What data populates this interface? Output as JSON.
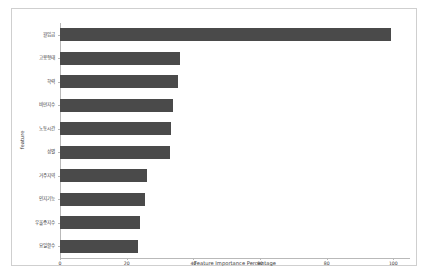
{
  "chart_data": {
    "type": "bar",
    "orientation": "horizontal",
    "title": "",
    "xlabel": "Feature Importance Percentage",
    "ylabel": "feature",
    "xlim": [
      0,
      105
    ],
    "xticks": [
      "0",
      "20",
      "40",
      "60",
      "80",
      "100"
    ],
    "xtick_values": [
      0,
      20,
      40,
      60,
      80,
      100
    ],
    "grid": false,
    "legend": null,
    "bar_color": "#4a4a4a",
    "background_color": "#ffffff",
    "frame_color": "#cfcfcf",
    "categories": [
      "월임금",
      "고용형태",
      "학력",
      "비만지수",
      "노동시간",
      "성별",
      "거주지역",
      "인지기능",
      "우울증지수",
      "요일활수"
    ],
    "values": [
      99.4,
      36.0,
      35.4,
      34.0,
      33.4,
      32.9,
      26.0,
      25.4,
      24.0,
      23.4
    ]
  }
}
